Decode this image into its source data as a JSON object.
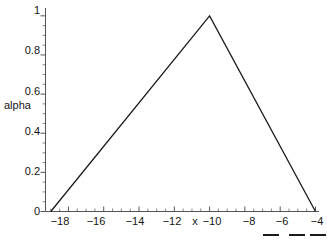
{
  "figure": {
    "background": "#ffffff",
    "line_color": "#1a1a1a",
    "axis_color": "#555555"
  },
  "chart_data": {
    "type": "line",
    "title": "",
    "xlabel": "x",
    "ylabel": "alpha",
    "xlim": [
      -19.3,
      -3.8
    ],
    "ylim": [
      0,
      1.04
    ],
    "grid": false,
    "legend": "none",
    "x": [
      -19,
      -10,
      -4
    ],
    "y": [
      0,
      1,
      0
    ],
    "series": [
      {
        "name": "alpha",
        "x": [
          -19,
          -10,
          -4
        ],
        "values": [
          0,
          1,
          0
        ]
      }
    ],
    "xticks": [
      -18,
      -16,
      -14,
      -12,
      -10,
      -8,
      -6,
      -4
    ],
    "xticklabels": [
      "−18",
      "−16",
      "−14",
      "−12",
      "−10",
      "−8",
      "−6",
      "−4"
    ],
    "yticks": [
      0,
      0.2,
      0.4,
      0.6,
      0.8,
      1
    ],
    "yticklabels": [
      "0",
      "0.2",
      "0.4",
      "0.6",
      "0.8",
      "1"
    ],
    "x_minor_tick_step": 0.5,
    "y_minor_tick_step": 0.05,
    "annotations": []
  },
  "axes": {
    "y_ticks": [
      {
        "label": "1",
        "top": 10
      },
      {
        "label": "0.8",
        "top": 50
      },
      {
        "label": "0.6",
        "top": 91
      },
      {
        "label": "0.4",
        "top": 131
      },
      {
        "label": "0.2",
        "top": 171
      },
      {
        "label": "0",
        "top": 211
      }
    ],
    "x_ticks": [
      {
        "label": "−18",
        "left": 60
      },
      {
        "label": "−16",
        "left": 96
      },
      {
        "label": "−14",
        "left": 135
      },
      {
        "label": "−12",
        "left": 172
      },
      {
        "label": "−10",
        "left": 212
      },
      {
        "label": "−8",
        "left": 249
      },
      {
        "label": "−6",
        "left": 282
      },
      {
        "label": "−4",
        "left": 317
      }
    ],
    "x_title": "x",
    "x_title_left": 195,
    "y_title": "alpha"
  },
  "legend_marks": [
    {
      "left": 263,
      "top": 234,
      "width": 16
    },
    {
      "left": 289,
      "top": 234,
      "width": 16
    },
    {
      "left": 310,
      "top": 234,
      "width": 16
    }
  ]
}
